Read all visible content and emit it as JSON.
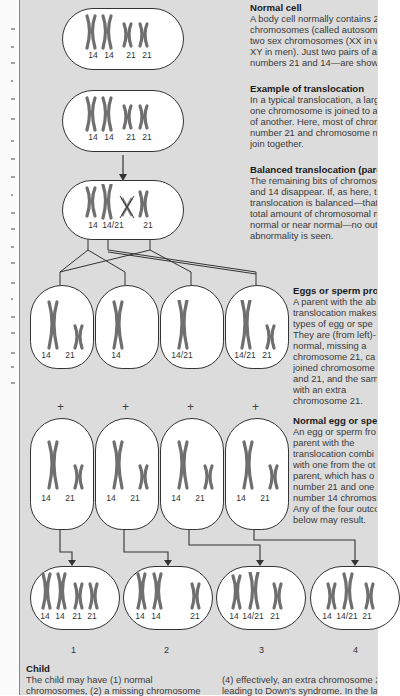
{
  "captions": {
    "normal_cell": {
      "title": "Normal cell",
      "lines": [
        "A body cell normally contains 22 pai",
        "chromosomes (called autosomes) pl",
        "two sex chromosomes (XX in women",
        "XY in men). Just two pairs of autoson",
        "numbers 21 and 14—are shown here"
      ]
    },
    "example_translocation": {
      "title": "Example of translocation",
      "lines": [
        "In a typical translocation, a large par",
        "one chromosome is joined to a large",
        "of another. Here, most of chromosom",
        "number 21 and chromosome numbe",
        "join together."
      ]
    },
    "balanced_translocation": {
      "title": "Balanced translocation (parent)",
      "lines": [
        "The remaining bits of chromosomes 2",
        "and 14 disappear. If, as here, the",
        "translocation is balanced—that is, the",
        "total amount of chromosomal materia",
        "normal or near normal—no outward",
        "abnormality is seen."
      ]
    },
    "eggs_or_sperm": {
      "title": "Eggs or sperm pro",
      "lines": [
        "A parent with the ab",
        "translocation makes",
        "types of egg or spe",
        "They are (from left)-",
        "normal, missing a",
        "chromosome 21, ca",
        "joined chromosome",
        "and 21, and the sam",
        "with an extra",
        "chromosome 21."
      ]
    },
    "normal_egg_or_sperm": {
      "title": "Normal egg or spe",
      "lines": [
        "An egg or sperm fro",
        "parent with the",
        "translocation combi",
        "with one from the ot",
        "parent, which has o",
        "number 21 and one",
        "number 14 chromos",
        "Any of the four outco",
        "below may result."
      ]
    },
    "child": {
      "title": "Child",
      "col1": [
        "The child may have (1) normal",
        "chromosomes, (2) a missing chromosome"
      ],
      "col2": [
        "(4) effectively, an extra chromosome 2",
        "leading to Down's syndrome. In the la"
      ]
    }
  },
  "cells": {
    "normal": [
      "14",
      "14",
      "21",
      "21"
    ],
    "translocation": [
      "14",
      "14",
      "21",
      "21"
    ],
    "balanced": [
      "14",
      "14/21",
      "21"
    ]
  },
  "gametes_parent": [
    [
      "14",
      "21"
    ],
    [
      "14"
    ],
    [
      "14/21"
    ],
    [
      "14/21",
      "21"
    ]
  ],
  "gametes_normal": [
    [
      "14",
      "21"
    ],
    [
      "14",
      "21"
    ],
    [
      "14",
      "21"
    ],
    [
      "14",
      "21"
    ]
  ],
  "children": [
    {
      "number": "1",
      "labels": [
        "14",
        "14",
        "21",
        "21"
      ]
    },
    {
      "number": "2",
      "labels": [
        "14",
        "14",
        "21"
      ]
    },
    {
      "number": "3",
      "labels": [
        "14",
        "14/21",
        "21"
      ]
    },
    {
      "number": "4",
      "labels": [
        "14",
        "14/21",
        "21"
      ]
    }
  ],
  "plus_sign": "+",
  "colors": {
    "panel_bg": "#dcdcdc",
    "cell_fill": "#ffffff",
    "chromosome": "#7a7a7a",
    "outline": "#333333"
  }
}
